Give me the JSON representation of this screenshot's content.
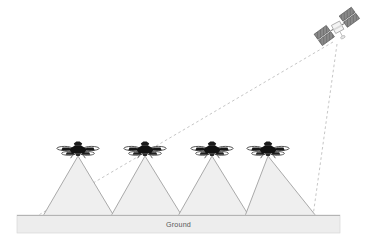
{
  "figure": {
    "background_color": "#ffffff"
  },
  "ground": {
    "label": "Ground",
    "fill_color": "#ededed",
    "stroke_color": "#c9c9c9",
    "label_color": "#58595b",
    "x": 17,
    "y": 215,
    "width": 323,
    "height": 18
  },
  "satellite": {
    "name": "satellite",
    "label": "",
    "body_color": "#f2f2f2",
    "panel_color": "#808080",
    "panel_edge_color": "#4d4d4d",
    "center_x": 338,
    "center_y": 28
  },
  "drones": [
    {
      "name": "drone-1",
      "label": "",
      "center_x": 78,
      "center_y": 150,
      "color": "#1a1a1a"
    },
    {
      "name": "drone-2",
      "label": "",
      "center_x": 145,
      "center_y": 150,
      "color": "#1a1a1a"
    },
    {
      "name": "drone-3",
      "label": "",
      "center_x": 212,
      "center_y": 150,
      "color": "#1a1a1a"
    },
    {
      "name": "drone-4",
      "label": "",
      "center_x": 268,
      "center_y": 150,
      "color": "#1a1a1a"
    }
  ],
  "coverage_cones": [
    {
      "name": "coverage-cone-1",
      "apex_x": 78,
      "apex_y": 156,
      "base_left_x": 43,
      "base_right_x": 114,
      "base_y": 216
    },
    {
      "name": "coverage-cone-2",
      "apex_x": 145,
      "apex_y": 156,
      "base_left_x": 111,
      "base_right_x": 182,
      "base_y": 216
    },
    {
      "name": "coverage-cone-3",
      "apex_x": 212,
      "apex_y": 156,
      "base_left_x": 178,
      "base_right_x": 249,
      "base_y": 216
    },
    {
      "name": "coverage-cone-4",
      "apex_x": 268,
      "apex_y": 156,
      "base_left_x": 245,
      "base_right_x": 316,
      "base_y": 216
    }
  ],
  "cone_style": {
    "fill_color": "#efefef",
    "stroke_color": "#a0a0a0"
  },
  "links": [
    {
      "name": "satellite-swath-left-link",
      "from_x": 333,
      "from_y": 42,
      "to_x": 37,
      "to_y": 216,
      "style": "dashed",
      "color": "#c6c6c6"
    },
    {
      "name": "satellite-swath-right-link",
      "from_x": 337,
      "from_y": 44,
      "to_x": 313,
      "to_y": 216,
      "style": "dashed",
      "color": "#c6c6c6"
    }
  ],
  "colors": {
    "cone_fill": "#efefef",
    "cone_stroke": "#a0a0a0",
    "ground_fill": "#ededed",
    "ground_stroke": "#c9c9c9",
    "link_dashed": "#c6c6c6",
    "drone_body": "#1a1a1a",
    "satellite_panel": "#808080",
    "background": "#ffffff"
  }
}
